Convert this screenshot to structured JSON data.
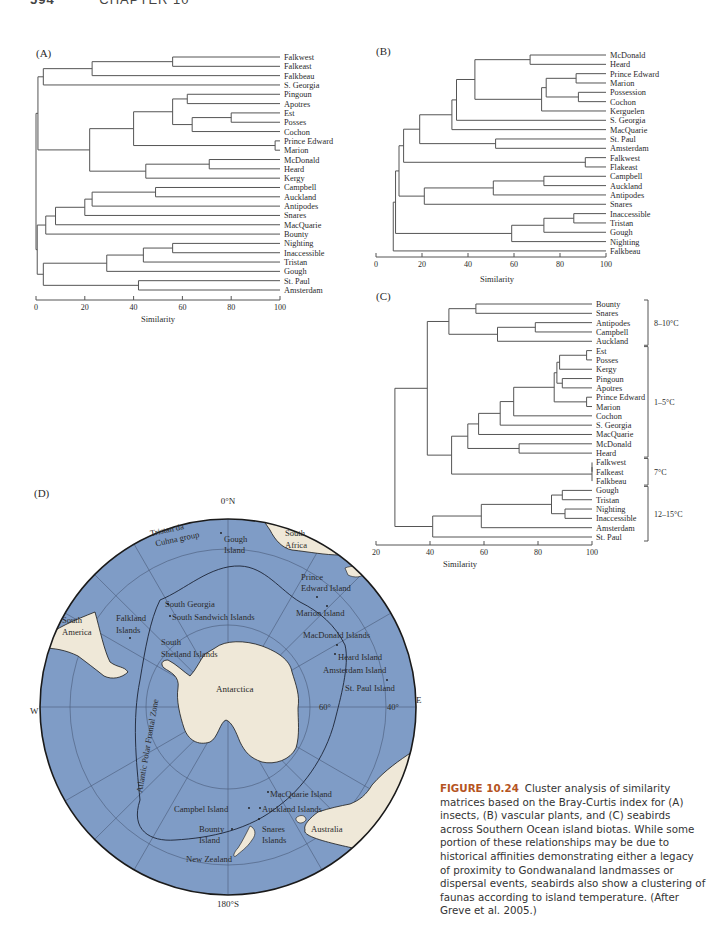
{
  "page_header": {
    "page_number": "594",
    "chapter": "CHAPTER 10"
  },
  "caption": {
    "figure_label": "FIGURE 10.24",
    "text": "Cluster analysis of similarity matrices based on the Bray-Curtis index for (A) insects, (B) vascular plants, and (C) seabirds across Southern Ocean island biotas. While some portion of these relationships may be due to historical affinities demonstrating either a legacy of proximity to Gondwanaland landmasses or dispersal events, seabirds also show a clustering of faunas according to island temperature. (After Greve et al. 2005.)"
  },
  "chart_data": [
    {
      "type": "dendrogram",
      "panel": "(A)",
      "title": "Insects",
      "xlabel": "Similarity",
      "xlim": [
        0,
        100
      ],
      "xticks": [
        0,
        20,
        40,
        60,
        80,
        100
      ],
      "leaves": [
        "Falkwest",
        "Falkeast",
        "Falkbeau",
        "S. Georgia",
        "Pingoun",
        "Apotres",
        "Est",
        "Posses",
        "Cochon",
        "Prince Edward",
        "Marion",
        "McDonald",
        "Heard",
        "Kergy",
        "Campbell",
        "Auckland",
        "Antipodes",
        "Snares",
        "MacQuarie",
        "Bounty",
        "Nighting",
        "Inaccessible",
        "Tristan",
        "Gough",
        "St. Paul",
        "Amsterdam"
      ],
      "merges": [
        {
          "a": "Falkwest",
          "b": "Falkeast",
          "similarity": 56
        },
        {
          "a": "Falkwest+Falkeast",
          "b": "Falkbeau",
          "similarity": 23
        },
        {
          "a": "Falklands",
          "b": "S. Georgia",
          "similarity": 3
        },
        {
          "a": "Pingoun",
          "b": "Apotres",
          "similarity": 62
        },
        {
          "a": "Est",
          "b": "Posses",
          "similarity": 80
        },
        {
          "a": "Est+Posses",
          "b": "Cochon",
          "similarity": 64
        },
        {
          "a": "Pingoun+Apotres",
          "b": "Est+Posses+Cochon",
          "similarity": 56
        },
        {
          "a": "Prince Edward",
          "b": "Marion",
          "similarity": 98
        },
        {
          "a": "Crozet group",
          "b": "Prince Edward+Marion",
          "similarity": 40
        },
        {
          "a": "McDonald",
          "b": "Heard",
          "similarity": 71
        },
        {
          "a": "McDonald+Heard",
          "b": "Kergy",
          "similarity": 45
        },
        {
          "a": "Crozet+PE",
          "b": "Kerguelen group",
          "similarity": 22
        },
        {
          "a": "Falklands+S. Georgia",
          "b": "Kerguelen+Crozet+PE",
          "similarity": 1
        },
        {
          "a": "Campbell",
          "b": "Auckland",
          "similarity": 49
        },
        {
          "a": "Campbell+Auckland",
          "b": "Antipodes",
          "similarity": 23
        },
        {
          "a": "Campbell+Auckland+Antipodes",
          "b": "Snares",
          "similarity": 20
        },
        {
          "a": "NZ subantarctic",
          "b": "MacQuarie",
          "similarity": 8
        },
        {
          "a": "NZ+MacQuarie",
          "b": "Bounty",
          "similarity": 4
        },
        {
          "a": "Upper cluster",
          "b": "NZ cluster",
          "similarity": 0.5
        },
        {
          "a": "Nighting",
          "b": "Inaccessible",
          "similarity": 56
        },
        {
          "a": "Nighting+Inaccessible",
          "b": "Tristan",
          "similarity": 44
        },
        {
          "a": "Tristan group",
          "b": "Gough",
          "similarity": 29
        },
        {
          "a": "St. Paul",
          "b": "Amsterdam",
          "similarity": 42
        },
        {
          "a": "Tristan+Gough",
          "b": "St. Paul+Amsterdam",
          "similarity": 3
        },
        {
          "a": "All others",
          "b": "Tristan/Gough/St.Paul/Amsterdam",
          "similarity": 0
        }
      ]
    },
    {
      "type": "dendrogram",
      "panel": "(B)",
      "title": "Vascular plants",
      "xlabel": "Similarity",
      "xlim": [
        0,
        100
      ],
      "xticks": [
        0,
        20,
        40,
        60,
        80,
        100
      ],
      "leaves": [
        "McDonald",
        "Heard",
        "Prince Edward",
        "Marion",
        "Possession",
        "Cochon",
        "Kerguelen",
        "S. Georgia",
        "MacQuarie",
        "St. Paul",
        "Amsterdam",
        "Falkwest",
        "Flakeast",
        "Campbell",
        "Auckland",
        "Antipodes",
        "Snares",
        "Inaccessible",
        "Tristan",
        "Gough",
        "Nighting",
        "Falkbeau"
      ],
      "merges": [
        {
          "a": "McDonald",
          "b": "Heard",
          "similarity": 67
        },
        {
          "a": "Prince Edward",
          "b": "Marion",
          "similarity": 87
        },
        {
          "a": "Possession",
          "b": "Cochon",
          "similarity": 88
        },
        {
          "a": "PE+Marion",
          "b": "Possession+Cochon",
          "similarity": 74
        },
        {
          "a": "PE/Marion/Poss/Cochon",
          "b": "Kerguelen",
          "similarity": 72
        },
        {
          "a": "McDonald+Heard",
          "b": "PE/Marion/Poss/Cochon/Kerg",
          "similarity": 43
        },
        {
          "a": "above",
          "b": "S. Georgia",
          "similarity": 35
        },
        {
          "a": "above",
          "b": "MacQuarie",
          "similarity": 33
        },
        {
          "a": "St. Paul",
          "b": "Amsterdam",
          "similarity": 52
        },
        {
          "a": "above",
          "b": "St. Paul+Amsterdam",
          "similarity": 19
        },
        {
          "a": "Falkwest",
          "b": "Flakeast",
          "similarity": 91
        },
        {
          "a": "above",
          "b": "Falkwest+Flakeast",
          "similarity": 12
        },
        {
          "a": "Campbell",
          "b": "Auckland",
          "similarity": 73
        },
        {
          "a": "Campbell+Auckland",
          "b": "Antipodes",
          "similarity": 51
        },
        {
          "a": "above",
          "b": "Snares",
          "similarity": 21
        },
        {
          "a": "Northern group",
          "b": "NZ group",
          "similarity": 10
        },
        {
          "a": "Inaccessible",
          "b": "Tristan",
          "similarity": 86
        },
        {
          "a": "Inacc+Tristan",
          "b": "Gough",
          "similarity": 73
        },
        {
          "a": "above",
          "b": "Nighting",
          "similarity": 59
        },
        {
          "a": "Main",
          "b": "Tristan group",
          "similarity": 9
        },
        {
          "a": "All",
          "b": "Falkbeau",
          "similarity": 7.5
        }
      ]
    },
    {
      "type": "dendrogram",
      "panel": "(C)",
      "title": "Seabirds",
      "xlabel": "Similarity",
      "xlim": [
        20,
        100
      ],
      "xticks": [
        20,
        40,
        60,
        80,
        100
      ],
      "leaves": [
        "Bounty",
        "Snares",
        "Antipodes",
        "Campbell",
        "Auckland",
        "Est",
        "Posses",
        "Kergy",
        "Pingoun",
        "Apotres",
        "Prince Edward",
        "Marion",
        "Cochon",
        "S. Georgia",
        "MacQuarie",
        "McDonald",
        "Heard",
        "Falkwest",
        "Falkeast",
        "Falkbeau",
        "Gough",
        "Tristan",
        "Nighting",
        "Inaccessible",
        "Amsterdam",
        "St. Paul"
      ],
      "groups": [
        {
          "label": "8–10°C",
          "from": "Bounty",
          "to": "Auckland"
        },
        {
          "label": "1–5°C",
          "from": "Est",
          "to": "Heard"
        },
        {
          "label": "7°C",
          "from": "Falkwest",
          "to": "Falkbeau"
        },
        {
          "label": "12–15°C",
          "from": "Gough",
          "to": "St. Paul"
        }
      ],
      "merges": [
        {
          "a": "Bounty",
          "b": "Snares",
          "similarity": 57
        },
        {
          "a": "Antipodes",
          "b": "Campbell",
          "similarity": 79
        },
        {
          "a": "Antipodes+Campbell",
          "b": "Auckland",
          "similarity": 65
        },
        {
          "a": "Bounty+Snares",
          "b": "Antip/Camp/Auck",
          "similarity": 47
        },
        {
          "a": "Est",
          "b": "Posses",
          "similarity": 98
        },
        {
          "a": "Est+Posses",
          "b": "Kergy",
          "similarity": 88
        },
        {
          "a": "Pingoun",
          "b": "Apotres",
          "similarity": 89
        },
        {
          "a": "Est/Posses/Kergy",
          "b": "Pingoun+Apotres",
          "similarity": 87
        },
        {
          "a": "Prince Edward",
          "b": "Marion",
          "similarity": 98
        },
        {
          "a": "above",
          "b": "PE+Marion",
          "similarity": 86
        },
        {
          "a": "above",
          "b": "Cochon",
          "similarity": 71
        },
        {
          "a": "above",
          "b": "S. Georgia",
          "similarity": 66
        },
        {
          "a": "above",
          "b": "MacQuarie",
          "similarity": 58
        },
        {
          "a": "McDonald",
          "b": "Heard",
          "similarity": 73
        },
        {
          "a": "1–5°C main",
          "b": "McDonald+Heard",
          "similarity": 54
        },
        {
          "a": "Falkwest",
          "b": "Falkeast",
          "similarity": 100
        },
        {
          "a": "Falkwest+Falkeast",
          "b": "Falkbeau",
          "similarity": 100
        },
        {
          "a": "1–5°C",
          "b": "7°C",
          "similarity": 48
        },
        {
          "a": "8–10°C",
          "b": "1–7°C",
          "similarity": 39
        },
        {
          "a": "Gough",
          "b": "Tristan",
          "similarity": 89
        },
        {
          "a": "Nighting",
          "b": "Inaccessible",
          "similarity": 90
        },
        {
          "a": "Gough+Tristan",
          "b": "Nighting+Inaccessible",
          "similarity": 85
        },
        {
          "a": "above",
          "b": "Amsterdam",
          "similarity": 59
        },
        {
          "a": "above",
          "b": "St. Paul",
          "similarity": 41
        },
        {
          "a": "Cold",
          "b": "Warm",
          "similarity": 27
        }
      ]
    }
  ],
  "panels": {
    "a": {
      "label": "(A)",
      "xlabel": "Similarity",
      "ticks": [
        "0",
        "20",
        "40",
        "60",
        "80",
        "100"
      ]
    },
    "b": {
      "label": "(B)",
      "xlabel": "Similarity",
      "ticks": [
        "0",
        "20",
        "40",
        "60",
        "80",
        "100"
      ]
    },
    "c": {
      "label": "(C)",
      "xlabel": "Similarity",
      "ticks": [
        "20",
        "40",
        "60",
        "80",
        "100"
      ],
      "groups": [
        "8–10°C",
        "1–5°C",
        "7°C",
        "12–15°C"
      ]
    },
    "d": {
      "label": "(D)",
      "compass": {
        "north": "0°N",
        "south": "180°S",
        "west": "W",
        "east": "E"
      },
      "lat_labels": [
        "60°",
        "40°"
      ],
      "front_label": "Atlantic Polar Frontal Zone",
      "places": {
        "tristan": [
          "Tristan da",
          "Cuhna group"
        ],
        "gough": [
          "Gough",
          "Island"
        ],
        "south_africa": [
          "South",
          "Africa"
        ],
        "prince_edward": [
          "Prince",
          "Edward Island"
        ],
        "marion": "Marion Island",
        "macdonald": "MacDonald Islands",
        "heard": "Heard Island",
        "amsterdam": "Amsterdam Island",
        "st_paul": "St. Paul Island",
        "south_america": [
          "South",
          "America"
        ],
        "falkland": [
          "Falkland",
          "Islands"
        ],
        "south_georgia": "South Georgia",
        "south_sandwich": "South Sandwich Islands",
        "south_shetland": [
          "South",
          "Shetland Islands"
        ],
        "antarctica": "Antarctica",
        "macquarie": "MacQuarie Island",
        "campbel": "Campbel Island",
        "auckland": "Auckland Islands",
        "bounty": [
          "Bounty",
          "Island"
        ],
        "snares": [
          "Snares",
          "Islands"
        ],
        "new_zealand": "New Zealand",
        "australia": "Australia"
      },
      "colors": {
        "ocean": "#7f9cc6",
        "land": "#efe8d8",
        "grid": "#4a5a78",
        "rim": "#1a1a1a"
      }
    }
  }
}
